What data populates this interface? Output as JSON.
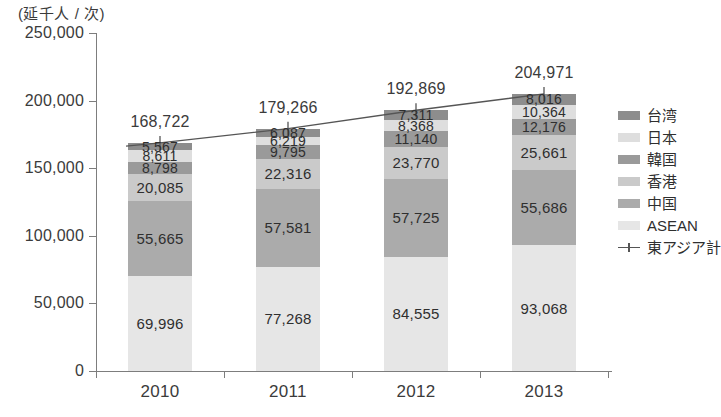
{
  "chart_data": {
    "type": "bar",
    "stacked": true,
    "title": "",
    "subtitle": "",
    "unit_caption": "(延千人 / 次)",
    "xlabel": "",
    "ylabel": "",
    "categories": [
      "2010",
      "2011",
      "2012",
      "2013"
    ],
    "ylim": [
      0,
      250000
    ],
    "ytick_values": [
      0,
      50000,
      100000,
      150000,
      200000,
      250000
    ],
    "ytick_labels": [
      "0",
      "50,000",
      "100,000",
      "150,000",
      "200,000",
      "250,000"
    ],
    "grid": false,
    "legend_position": "right",
    "series": [
      {
        "name": "台湾",
        "color": "#8d8d8d",
        "values": [
          5567,
          6087,
          7311,
          8016
        ],
        "labels": [
          "5,567",
          "6,087",
          "7,311",
          "8,016"
        ]
      },
      {
        "name": "日本",
        "color": "#dedede",
        "values": [
          8611,
          6219,
          8368,
          10364
        ],
        "labels": [
          "8,611",
          "6,219",
          "8,368",
          "10,364"
        ]
      },
      {
        "name": "韓国",
        "color": "#9a9a9a",
        "values": [
          8798,
          9795,
          11140,
          12176
        ],
        "labels": [
          "8,798",
          "9,795",
          "11,140",
          "12,176"
        ]
      },
      {
        "name": "香港",
        "color": "#cacaca",
        "values": [
          20085,
          22316,
          23770,
          25661
        ],
        "labels": [
          "20,085",
          "22,316",
          "23,770",
          "25,661"
        ]
      },
      {
        "name": "中国",
        "color": "#ababab",
        "values": [
          55665,
          57581,
          57725,
          55686
        ],
        "labels": [
          "55,665",
          "57,581",
          "57,725",
          "55,686"
        ]
      },
      {
        "name": "ASEAN",
        "color": "#e6e6e6",
        "values": [
          69996,
          77268,
          84555,
          93068
        ],
        "labels": [
          "69,996",
          "77,268",
          "84,555",
          "93,068"
        ]
      }
    ],
    "line_series": {
      "name": "東アジア計",
      "color": "#555555",
      "marker": "plus",
      "values": [
        168722,
        179266,
        192869,
        204971
      ],
      "labels": [
        "168,722",
        "179,266",
        "192,869",
        "204,971"
      ]
    }
  },
  "legend": {
    "items": [
      {
        "label": "台湾",
        "swatch": "#8d8d8d",
        "type": "swatch"
      },
      {
        "label": "日本",
        "swatch": "#dedede",
        "type": "swatch"
      },
      {
        "label": "韓国",
        "swatch": "#9a9a9a",
        "type": "swatch"
      },
      {
        "label": "香港",
        "swatch": "#cacaca",
        "type": "swatch"
      },
      {
        "label": "中国",
        "swatch": "#ababab",
        "type": "swatch"
      },
      {
        "label": "ASEAN",
        "swatch": "#e6e6e6",
        "type": "swatch"
      },
      {
        "label": "東アジア計",
        "swatch": "#555555",
        "type": "line"
      }
    ]
  },
  "colors": {
    "axis": "#7d7d7d",
    "text": "#3b3b3b",
    "background": "#ffffff",
    "line": "#555555"
  }
}
